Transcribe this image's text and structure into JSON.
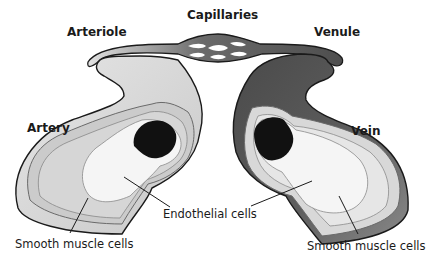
{
  "diagram": {
    "title_labels": {
      "capillaries": "Capillaries",
      "arteriole": "Arteriole",
      "venule": "Venule",
      "artery": "Artery",
      "vein": "Vein"
    },
    "callouts": {
      "endothelial": "Endothelial cells",
      "smooth_muscle_left": "Smooth muscle cells",
      "smooth_muscle_right": "Smooth muscle cells"
    },
    "colors": {
      "artery_outer": "#d2d2d2",
      "artery_mid": "#c4c4c4",
      "lumen_light": "#f4f4f4",
      "blood_dark": "#111111",
      "vein_outer": "#585858",
      "vein_gradient_end": "#8a8a8a",
      "vein_muscle": "#d8d8d8",
      "outline": "#1a1a1a"
    }
  }
}
